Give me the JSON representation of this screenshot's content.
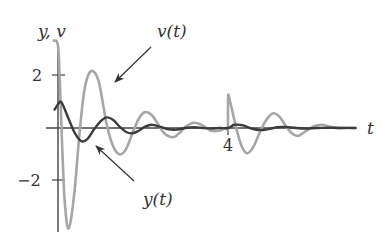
{
  "chart_data": {
    "type": "line",
    "title": "",
    "xlabel": "t",
    "ylabel": "y, v",
    "xlim": [
      0,
      7
    ],
    "ylim": [
      -3.9,
      3.2
    ],
    "x_ticks": [
      {
        "value": 4,
        "label": "4"
      }
    ],
    "y_ticks": [
      {
        "value": 2,
        "label": "2"
      },
      {
        "value": -2,
        "label": "−2"
      }
    ],
    "grid": false,
    "legend": "none (curves labeled by annotations with arrows)",
    "series": [
      {
        "name": "v(t)",
        "color": "#a6a6a6",
        "description": "velocity: large damped oscillation, kicked again at t = 4",
        "points": [
          [
            -0.1,
            3.3
          ],
          [
            0.0,
            3.1
          ],
          [
            0.05,
            1.5
          ],
          [
            0.1,
            -0.8
          ],
          [
            0.15,
            -2.6
          ],
          [
            0.2,
            -3.5
          ],
          [
            0.24,
            -3.8
          ],
          [
            0.3,
            -3.5
          ],
          [
            0.4,
            -2.2
          ],
          [
            0.5,
            -0.3
          ],
          [
            0.6,
            1.2
          ],
          [
            0.7,
            1.95
          ],
          [
            0.82,
            2.15
          ],
          [
            0.95,
            1.8
          ],
          [
            1.05,
            1.0
          ],
          [
            1.15,
            0.1
          ],
          [
            1.3,
            -0.7
          ],
          [
            1.46,
            -1.0
          ],
          [
            1.6,
            -0.8
          ],
          [
            1.75,
            -0.2
          ],
          [
            1.9,
            0.35
          ],
          [
            2.05,
            0.6
          ],
          [
            2.2,
            0.5
          ],
          [
            2.35,
            0.15
          ],
          [
            2.5,
            -0.2
          ],
          [
            2.7,
            -0.35
          ],
          [
            2.85,
            -0.2
          ],
          [
            3.0,
            0.05
          ],
          [
            3.2,
            0.2
          ],
          [
            3.4,
            0.1
          ],
          [
            3.6,
            -0.1
          ],
          [
            3.8,
            -0.1
          ],
          [
            3.95,
            0.0
          ],
          [
            4.0,
            0.0
          ],
          [
            4.0,
            1.2
          ],
          [
            4.05,
            1.0
          ],
          [
            4.15,
            0.3
          ],
          [
            4.3,
            -0.6
          ],
          [
            4.45,
            -0.95
          ],
          [
            4.6,
            -0.7
          ],
          [
            4.75,
            -0.15
          ],
          [
            4.9,
            0.3
          ],
          [
            5.05,
            0.55
          ],
          [
            5.2,
            0.45
          ],
          [
            5.35,
            0.1
          ],
          [
            5.5,
            -0.2
          ],
          [
            5.65,
            -0.3
          ],
          [
            5.8,
            -0.15
          ],
          [
            6.0,
            0.05
          ],
          [
            6.2,
            0.12
          ],
          [
            6.4,
            0.05
          ],
          [
            6.6,
            -0.02
          ],
          [
            6.8,
            0.0
          ],
          [
            7.0,
            0.0
          ]
        ]
      },
      {
        "name": "y(t)",
        "color": "#3c3c3c",
        "description": "position: small damped oscillation starting near 1, small kick at t = 4",
        "points": [
          [
            -0.08,
            0.7
          ],
          [
            0.0,
            0.9
          ],
          [
            0.06,
            1.0
          ],
          [
            0.12,
            0.85
          ],
          [
            0.25,
            0.35
          ],
          [
            0.4,
            -0.2
          ],
          [
            0.56,
            -0.5
          ],
          [
            0.7,
            -0.4
          ],
          [
            0.85,
            -0.05
          ],
          [
            1.0,
            0.25
          ],
          [
            1.15,
            0.4
          ],
          [
            1.3,
            0.3
          ],
          [
            1.45,
            0.05
          ],
          [
            1.6,
            -0.15
          ],
          [
            1.75,
            -0.2
          ],
          [
            1.9,
            -0.1
          ],
          [
            2.05,
            0.05
          ],
          [
            2.2,
            0.12
          ],
          [
            2.4,
            0.05
          ],
          [
            2.6,
            -0.05
          ],
          [
            2.8,
            -0.06
          ],
          [
            3.0,
            0.0
          ],
          [
            3.2,
            0.03
          ],
          [
            3.4,
            0.0
          ],
          [
            3.6,
            -0.02
          ],
          [
            3.8,
            0.0
          ],
          [
            4.0,
            0.0
          ],
          [
            4.15,
            0.12
          ],
          [
            4.35,
            0.1
          ],
          [
            4.55,
            -0.02
          ],
          [
            4.75,
            -0.08
          ],
          [
            4.95,
            -0.04
          ],
          [
            5.15,
            0.03
          ],
          [
            5.35,
            0.04
          ],
          [
            5.6,
            0.0
          ],
          [
            5.85,
            -0.02
          ],
          [
            6.1,
            0.0
          ],
          [
            6.5,
            0.01
          ],
          [
            7.0,
            0.0
          ]
        ]
      }
    ],
    "annotations": [
      {
        "text": "v(t)",
        "arrow_to": [
          1.0,
          1.6
        ]
      },
      {
        "text": "y(t)",
        "arrow_to": [
          0.95,
          -0.7
        ]
      }
    ]
  },
  "labels": {
    "y_axis": "y, v",
    "x_axis": "t",
    "tick_pos2": "2",
    "tick_neg2": "−2",
    "tick_t4": "4",
    "v_label": "v(t)",
    "y_label": "y(t)"
  }
}
